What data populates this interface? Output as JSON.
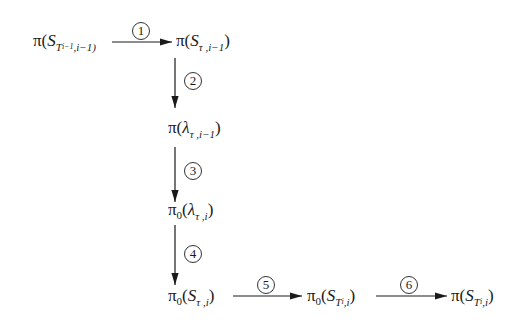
{
  "diagram": {
    "type": "flow",
    "nodes": [
      {
        "id": "n1",
        "text": "π(S_{T_{i-1}}, i-1)",
        "pi": "π",
        "var": "S",
        "sub": "T",
        "subsub": "i−1",
        "idx": ",i−1)"
      },
      {
        "id": "n2",
        "text": "π(S_{τ,i-1})",
        "pi": "π",
        "var": "S",
        "sub": "τ ,i−1"
      },
      {
        "id": "n3",
        "text": "π(λ_{τ,i-1})",
        "pi": "π",
        "var": "λ",
        "sub": "τ ,i−1"
      },
      {
        "id": "n4",
        "text": "π0(λ_{τ,i})",
        "pi": "π",
        "zero": "0",
        "var": "λ",
        "sub": "τ ,i"
      },
      {
        "id": "n5",
        "text": "π0(S_{τ,i})",
        "pi": "π",
        "zero": "0",
        "var": "S",
        "sub": "τ ,i"
      },
      {
        "id": "n6",
        "text": "π0(S_{T_i, i})",
        "pi": "π",
        "zero": "0",
        "var": "S",
        "sub": "T",
        "subsub": "i",
        "idx": ",i"
      },
      {
        "id": "n7",
        "text": "π(S_{T_i, i})",
        "pi": "π",
        "var": "S",
        "sub": "T",
        "subsub": "i",
        "idx": ",i"
      }
    ],
    "edges": [
      {
        "from": "n1",
        "to": "n2",
        "label": "①"
      },
      {
        "from": "n2",
        "to": "n3",
        "label": "②"
      },
      {
        "from": "n3",
        "to": "n4",
        "label": "③"
      },
      {
        "from": "n4",
        "to": "n5",
        "label": "④"
      },
      {
        "from": "n5",
        "to": "n6",
        "label": "⑤"
      },
      {
        "from": "n6",
        "to": "n7",
        "label": "⑥"
      }
    ],
    "labels": [
      "1",
      "2",
      "3",
      "4",
      "5",
      "6"
    ],
    "paren_open": "(",
    "paren_close": ")"
  }
}
